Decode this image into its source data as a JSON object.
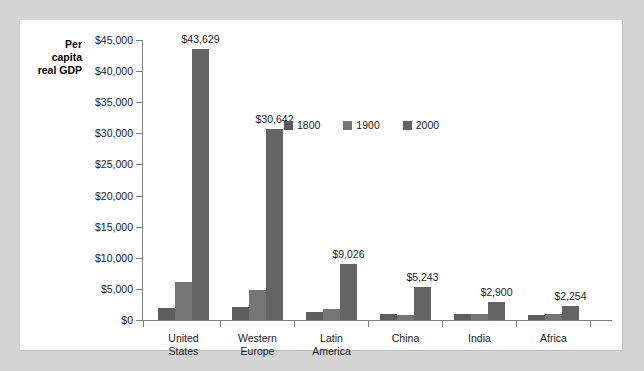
{
  "chart_data": {
    "type": "bar",
    "title": "",
    "subtitle": "",
    "xlabel": "",
    "ylabel": "Per capita real GDP",
    "ylabel_lines": [
      "Per",
      "capita",
      "real GDP"
    ],
    "categories": [
      "United States",
      "Western Europe",
      "Latin America",
      "China",
      "India",
      "Africa"
    ],
    "category_lines": [
      [
        "United",
        "States"
      ],
      [
        "Western",
        "Europe"
      ],
      [
        "Latin",
        "America"
      ],
      [
        "China"
      ],
      [
        "India"
      ],
      [
        "Africa"
      ]
    ],
    "series": [
      {
        "name": "1800",
        "color": "#5d5d5d",
        "values": [
          1980,
          2060,
          1300,
          950,
          900,
          760
        ]
      },
      {
        "name": "1900",
        "color": "#767676",
        "values": [
          6180,
          4850,
          1800,
          870,
          920,
          900
        ]
      },
      {
        "name": "2000",
        "color": "#646464",
        "values": [
          43629,
          30642,
          9026,
          5243,
          2900,
          2254
        ]
      }
    ],
    "data_labels": [
      "$43,629",
      "$30,642",
      "$9,026",
      "$5,243",
      "$2,900",
      "$2,254"
    ],
    "data_label_values": [
      43629,
      30642,
      9026,
      5243,
      2900,
      2254
    ],
    "ylim": [
      0,
      45000
    ],
    "ytick_values": [
      0,
      5000,
      10000,
      15000,
      20000,
      25000,
      30000,
      35000,
      40000,
      45000
    ],
    "ytick_labels": [
      "$0",
      "$5,000",
      "$10,000",
      "$15,000",
      "$20,000",
      "$25,000",
      "$30,000",
      "$35,000",
      "$40,000",
      "$45,000"
    ],
    "grid": false,
    "legend_position": "inside-upper-right",
    "legend_entries": [
      "1800",
      "1900",
      "2000"
    ]
  },
  "colors": {
    "page_background": "#d4d4d4",
    "panel_background": "#ffffff",
    "axis": "#808080",
    "text": "#1c1c1c",
    "series_1800": "#5d5d5d",
    "series_1900": "#767676",
    "series_2000": "#646464"
  }
}
